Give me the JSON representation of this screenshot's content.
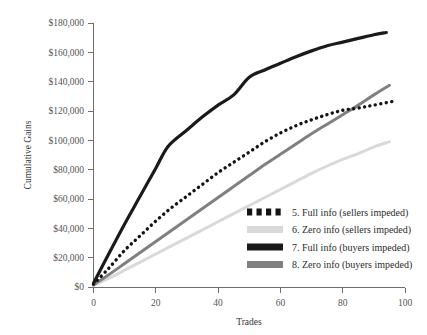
{
  "chart_data": {
    "type": "line",
    "title": "",
    "xlabel": "Trades",
    "ylabel": "Cumulative Gains",
    "xlim": [
      0,
      100
    ],
    "ylim": [
      0,
      180000
    ],
    "grid": false,
    "legend_position": "inside-bottom-right",
    "x_ticks": [
      0,
      20,
      40,
      60,
      80,
      100
    ],
    "x_tick_labels": [
      "0",
      "20",
      "40",
      "60",
      "80",
      "100"
    ],
    "y_ticks": [
      0,
      20000,
      40000,
      60000,
      80000,
      100000,
      120000,
      140000,
      160000,
      180000
    ],
    "y_tick_labels": [
      "$0",
      "$20,000",
      "$40,000",
      "$60,000",
      "$80,000",
      "$100,000",
      "$120,000",
      "$140,000",
      "$160,000",
      "$180,000"
    ],
    "series": [
      {
        "name": "5. Full info (sellers impeded)",
        "style": "dotted",
        "color": "#141414",
        "x": [
          0,
          5,
          10,
          15,
          20,
          25,
          30,
          35,
          40,
          45,
          50,
          55,
          60,
          65,
          70,
          75,
          80,
          85,
          90,
          96
        ],
        "y": [
          2000,
          13000,
          25000,
          35000,
          45000,
          54000,
          62000,
          70000,
          78000,
          85000,
          92000,
          99000,
          105000,
          110000,
          114000,
          117500,
          120500,
          122000,
          124000,
          126500
        ]
      },
      {
        "name": "6. Zero info (sellers impeded)",
        "style": "solid",
        "color": "#d9d9d9",
        "x": [
          0,
          5,
          10,
          15,
          20,
          25,
          30,
          35,
          40,
          45,
          50,
          55,
          60,
          65,
          70,
          75,
          80,
          85,
          90,
          95
        ],
        "y": [
          1000,
          6000,
          11500,
          17000,
          22500,
          28000,
          33500,
          39000,
          44500,
          50000,
          55500,
          61000,
          66500,
          72000,
          77500,
          82500,
          87000,
          91000,
          95500,
          99000
        ]
      },
      {
        "name": "7. Full info (buyers impeded)",
        "style": "solid",
        "color": "#1a1a1a",
        "x": [
          0,
          5,
          10,
          15,
          20,
          24,
          30,
          35,
          40,
          45,
          50,
          55,
          60,
          65,
          70,
          75,
          80,
          85,
          90,
          94
        ],
        "y": [
          2500,
          23000,
          43000,
          62000,
          81000,
          96000,
          107000,
          116000,
          124000,
          131000,
          143000,
          148000,
          152500,
          157000,
          161000,
          164500,
          167000,
          169500,
          172000,
          173500
        ]
      },
      {
        "name": "8. Zero info (buyers impeded)",
        "style": "solid",
        "color": "#808080",
        "x": [
          0,
          5,
          10,
          15,
          20,
          25,
          30,
          35,
          40,
          45,
          50,
          55,
          60,
          65,
          70,
          75,
          80,
          85,
          90,
          95
        ],
        "y": [
          1500,
          8500,
          16000,
          23500,
          31000,
          38500,
          46000,
          53500,
          61000,
          68500,
          76000,
          83500,
          90500,
          97500,
          104500,
          111000,
          117500,
          124000,
          131000,
          137500
        ]
      }
    ]
  },
  "legend": {
    "entries": [
      {
        "label": "5. Full info (sellers impeded)",
        "swatch": "dotted-black",
        "color": "#141414"
      },
      {
        "label": "6. Zero info (sellers impeded)",
        "swatch": "solid-light-gray",
        "color": "#d9d9d9"
      },
      {
        "label": "7. Full info (buyers impeded)",
        "swatch": "solid-black",
        "color": "#1a1a1a"
      },
      {
        "label": "8. Zero info (buyers impeded)",
        "swatch": "solid-gray",
        "color": "#808080"
      }
    ]
  },
  "axes": {
    "x_title": "Trades",
    "y_title": "Cumulative Gains"
  }
}
